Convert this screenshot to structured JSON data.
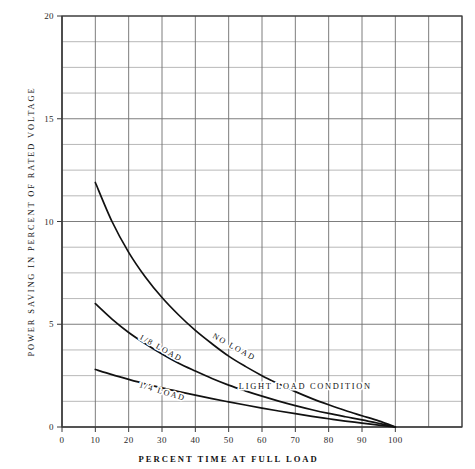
{
  "chart_data": {
    "type": "line",
    "title": "",
    "xlabel": "PERCENT TIME AT FULL LOAD",
    "ylabel": "POWER SAVING IN PERCENT OF RATED VOLTAGE",
    "xlim": [
      0,
      120
    ],
    "ylim": [
      0,
      20
    ],
    "xticks": [
      0,
      10,
      20,
      30,
      40,
      50,
      60,
      70,
      80,
      90,
      100
    ],
    "xtick_labels": [
      "0",
      "10",
      "20",
      "30",
      "40",
      "50",
      "60",
      "70",
      "80",
      "90",
      "100"
    ],
    "yticks": [
      0,
      5,
      10,
      15,
      20
    ],
    "ytick_labels": [
      "0",
      "5",
      "10",
      "15",
      "20"
    ],
    "grid": true,
    "grid_x_step": 10,
    "grid_y_step": 1.25,
    "legend_position": "inline-curve-labels",
    "annotations": [
      {
        "name": "light-load-condition",
        "text": "LIGHT LOAD CONDITION",
        "x": 73,
        "y": 1.85,
        "rotation": 0
      }
    ],
    "series": [
      {
        "name": "NO LOAD",
        "label": "NO LOAD",
        "label_x": 45,
        "label_y": 4.35,
        "label_rotation": 29,
        "color": "#111111",
        "x": [
          10,
          15,
          20,
          25,
          30,
          35,
          40,
          45,
          50,
          55,
          60,
          65,
          70,
          75,
          80,
          85,
          90,
          95,
          100
        ],
        "y": [
          11.9,
          10.0,
          8.5,
          7.3,
          6.3,
          5.45,
          4.7,
          4.05,
          3.45,
          2.95,
          2.5,
          2.1,
          1.72,
          1.38,
          1.08,
          0.8,
          0.55,
          0.3,
          0.0
        ]
      },
      {
        "name": "1/8 LOAD",
        "label": "1/8 LOAD",
        "label_x": 23,
        "label_y": 4.3,
        "label_rotation": 29,
        "color": "#111111",
        "x": [
          10,
          15,
          20,
          25,
          30,
          35,
          40,
          45,
          50,
          55,
          60,
          65,
          70,
          75,
          80,
          85,
          90,
          95,
          100
        ],
        "y": [
          6.0,
          5.25,
          4.6,
          4.05,
          3.55,
          3.1,
          2.72,
          2.36,
          2.04,
          1.76,
          1.5,
          1.26,
          1.04,
          0.84,
          0.66,
          0.5,
          0.35,
          0.18,
          0.0
        ]
      },
      {
        "name": "1/4 LOAD",
        "label": "1/4 LOAD",
        "label_x": 23,
        "label_y": 1.95,
        "label_rotation": 17,
        "color": "#111111",
        "x": [
          10,
          15,
          20,
          25,
          30,
          35,
          40,
          45,
          50,
          55,
          60,
          65,
          70,
          75,
          80,
          85,
          90,
          95,
          100
        ],
        "y": [
          2.8,
          2.55,
          2.32,
          2.1,
          1.9,
          1.72,
          1.55,
          1.38,
          1.22,
          1.07,
          0.92,
          0.78,
          0.65,
          0.52,
          0.4,
          0.29,
          0.19,
          0.09,
          0.0
        ]
      }
    ]
  }
}
